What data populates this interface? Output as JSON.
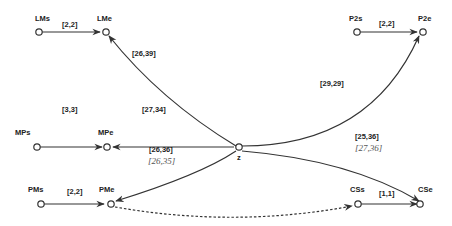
{
  "diagram": {
    "nodes": {
      "LMs": {
        "label": "LMs"
      },
      "LMe": {
        "label": "LMe"
      },
      "P2s": {
        "label": "P2s"
      },
      "P2e": {
        "label": "P2e"
      },
      "MPs": {
        "label": "MPs"
      },
      "MPe": {
        "label": "MPe"
      },
      "z": {
        "label": "z"
      },
      "PMs": {
        "label": "PMs"
      },
      "PMe": {
        "label": "PMe"
      },
      "CSs": {
        "label": "CSs"
      },
      "CSe": {
        "label": "CSe"
      }
    },
    "edges": {
      "LMs_LMe": {
        "label": "[2,2]"
      },
      "z_LMe": {
        "label": "[26,39]"
      },
      "P2s_P2e": {
        "label": "[2,2]"
      },
      "z_P2e": {
        "label": "[29,29]"
      },
      "MPs_MPe": {
        "label": "[3,3]"
      },
      "z_MPe": {
        "label": "[27,34]"
      },
      "z_PMe": {
        "label": "[26,36]",
        "alt_label": "[26,35]"
      },
      "z_CSe": {
        "label": "[25,36]",
        "alt_label": "[27,36]"
      },
      "PMs_PMe": {
        "label": "[2,2]"
      },
      "CSs_CSe": {
        "label": "[1,1]"
      },
      "PMe_CSs": {
        "label": "",
        "style": "dashed"
      }
    }
  }
}
